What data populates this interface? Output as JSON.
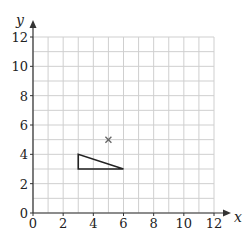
{
  "chart_data": {
    "type": "scatter",
    "title": "",
    "xlabel": "x",
    "ylabel": "y",
    "xlim": [
      0,
      12
    ],
    "ylim": [
      0,
      12
    ],
    "grid": true,
    "grid_step": 1,
    "x_ticks": [
      0,
      2,
      4,
      6,
      8,
      10,
      12
    ],
    "y_ticks": [
      0,
      2,
      4,
      6,
      8,
      10,
      12
    ],
    "shapes": [
      {
        "name": "triangle",
        "type": "polygon",
        "vertices": [
          [
            3,
            3
          ],
          [
            3,
            4
          ],
          [
            6,
            3
          ]
        ]
      }
    ],
    "points": [
      {
        "name": "center-marker",
        "marker": "x",
        "x": 5,
        "y": 5
      }
    ]
  },
  "colors": {
    "grid": "#cfcfcf",
    "axis": "#333333",
    "shape": "#222222",
    "marker": "#666666"
  }
}
